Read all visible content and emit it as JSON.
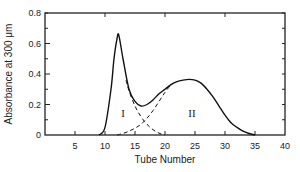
{
  "chart_data": {
    "type": "line",
    "title": "",
    "xlabel": "Tube Number",
    "ylabel": "Absorbance at 300 μm",
    "xlim": [
      0,
      40
    ],
    "ylim": [
      0,
      0.8
    ],
    "x_ticks": [
      5,
      10,
      15,
      20,
      25,
      30,
      35,
      40
    ],
    "x_tick_labels": [
      "5",
      "10",
      "15",
      "20",
      "25",
      "30",
      "35",
      "40"
    ],
    "y_ticks": [
      0,
      0.2,
      0.4,
      0.6,
      0.8
    ],
    "y_tick_labels": [
      "0",
      "0.2",
      "0.4",
      "0.6",
      "0.8"
    ],
    "grid": false,
    "legend": null,
    "series": [
      {
        "name": "Total (solid)",
        "style": "solid",
        "x": [
          9,
          10,
          11,
          11.5,
          12,
          12.3,
          13,
          14,
          15,
          16,
          17,
          18,
          19,
          20,
          21,
          22,
          23,
          24,
          25,
          26,
          27,
          28,
          29,
          30,
          31,
          32,
          33,
          34,
          35
        ],
        "y": [
          0.0,
          0.05,
          0.3,
          0.5,
          0.63,
          0.655,
          0.5,
          0.3,
          0.22,
          0.19,
          0.2,
          0.23,
          0.27,
          0.3,
          0.33,
          0.35,
          0.36,
          0.365,
          0.36,
          0.34,
          0.3,
          0.25,
          0.19,
          0.13,
          0.08,
          0.05,
          0.025,
          0.01,
          0.0
        ]
      },
      {
        "name": "Component I (dashed)",
        "style": "dashed",
        "x": [
          13.5,
          14,
          15,
          16,
          17,
          18,
          19,
          20
        ],
        "y": [
          0.36,
          0.29,
          0.19,
          0.12,
          0.07,
          0.035,
          0.012,
          0.0
        ]
      },
      {
        "name": "Component II (dashed)",
        "style": "dashed",
        "x": [
          12,
          13,
          14,
          15,
          16,
          17,
          18,
          19,
          20,
          21
        ],
        "y": [
          0.0,
          0.01,
          0.025,
          0.045,
          0.07,
          0.11,
          0.16,
          0.22,
          0.28,
          0.33
        ]
      }
    ],
    "annotations": [
      {
        "text": "I",
        "x": 13,
        "y": 0.12
      },
      {
        "text": "II",
        "x": 24.5,
        "y": 0.12
      }
    ]
  }
}
